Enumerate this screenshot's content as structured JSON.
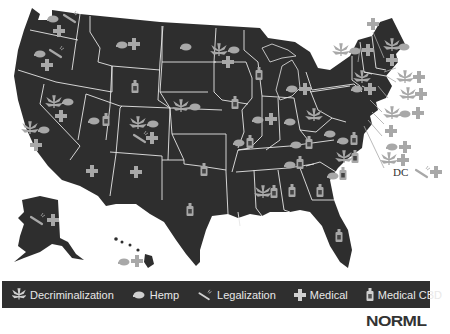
{
  "colors": {
    "land": "#2e2e2e",
    "border": "#e6e6e6",
    "icon": "#a8a8a8",
    "legend_bg": "#2f2f2f",
    "legend_text": "#e8e8e8",
    "logo": "#333333"
  },
  "legend": {
    "items": [
      {
        "icon": "leaf-icon",
        "label": "Decriminalization"
      },
      {
        "icon": "hemp-cap-icon",
        "label": "Hemp"
      },
      {
        "icon": "joint-icon",
        "label": "Legalization"
      },
      {
        "icon": "cross-icon",
        "label": "Medical"
      },
      {
        "icon": "bottle-icon",
        "label": "Medical CBD"
      }
    ]
  },
  "logo": {
    "text": "NORML"
  },
  "callouts": {
    "dc_label": "DC"
  },
  "states": [
    {
      "name": "WA",
      "policies": [
        "hemp",
        "legalization",
        "medical"
      ]
    },
    {
      "name": "OR",
      "policies": [
        "hemp",
        "legalization",
        "medical"
      ]
    },
    {
      "name": "CA",
      "policies": [
        "decriminalization",
        "hemp",
        "medical"
      ]
    },
    {
      "name": "NV",
      "policies": [
        "decriminalization",
        "hemp",
        "medical"
      ]
    },
    {
      "name": "MT",
      "policies": [
        "hemp",
        "medical"
      ]
    },
    {
      "name": "ND",
      "policies": [
        "hemp"
      ]
    },
    {
      "name": "WY",
      "policies": [
        "medical_cbd"
      ]
    },
    {
      "name": "UT",
      "policies": [
        "hemp",
        "medical_cbd"
      ]
    },
    {
      "name": "CO",
      "policies": [
        "decriminalization",
        "hemp",
        "legalization",
        "medical"
      ]
    },
    {
      "name": "NE",
      "policies": [
        "decriminalization",
        "hemp"
      ]
    },
    {
      "name": "AZ",
      "policies": [
        "medical"
      ]
    },
    {
      "name": "NM",
      "policies": [
        "medical"
      ]
    },
    {
      "name": "OK",
      "policies": [
        "medical_cbd"
      ]
    },
    {
      "name": "TX",
      "policies": [
        "medical_cbd"
      ]
    },
    {
      "name": "MN",
      "policies": [
        "decriminalization",
        "hemp",
        "medical"
      ]
    },
    {
      "name": "WI",
      "policies": [
        "medical_cbd"
      ]
    },
    {
      "name": "IA",
      "policies": [
        "medical_cbd"
      ]
    },
    {
      "name": "MO",
      "policies": [
        "hemp",
        "medical_cbd"
      ]
    },
    {
      "name": "IL",
      "policies": [
        "hemp",
        "medical"
      ]
    },
    {
      "name": "MI",
      "policies": [
        "hemp",
        "medical"
      ]
    },
    {
      "name": "IN",
      "policies": [
        "hemp"
      ]
    },
    {
      "name": "OH",
      "policies": [
        "decriminalization"
      ]
    },
    {
      "name": "KY",
      "policies": [
        "hemp",
        "medical_cbd"
      ]
    },
    {
      "name": "TN",
      "policies": [
        "hemp",
        "medical_cbd"
      ]
    },
    {
      "name": "MS",
      "policies": [
        "decriminalization",
        "medical_cbd"
      ]
    },
    {
      "name": "AL",
      "policies": [
        "medical_cbd"
      ]
    },
    {
      "name": "GA",
      "policies": [
        "medical_cbd"
      ]
    },
    {
      "name": "FL",
      "policies": [
        "medical_cbd"
      ]
    },
    {
      "name": "SC",
      "policies": [
        "hemp",
        "medical_cbd"
      ]
    },
    {
      "name": "NC",
      "policies": [
        "decriminalization",
        "medical_cbd"
      ]
    },
    {
      "name": "VA",
      "policies": [
        "hemp",
        "medical_cbd"
      ]
    },
    {
      "name": "WV",
      "policies": [
        "hemp"
      ]
    },
    {
      "name": "NY",
      "policies": [
        "decriminalization",
        "hemp",
        "medical"
      ]
    },
    {
      "name": "ME",
      "policies": [
        "decriminalization",
        "hemp",
        "medical"
      ]
    },
    {
      "name": "VT",
      "policies": [
        "decriminalization",
        "hemp",
        "medical"
      ]
    },
    {
      "name": "NH",
      "policies": [
        "medical"
      ]
    },
    {
      "name": "MA",
      "policies": [
        "decriminalization",
        "medical"
      ]
    },
    {
      "name": "RI",
      "policies": [
        "decriminalization",
        "medical"
      ]
    },
    {
      "name": "CT",
      "policies": [
        "decriminalization",
        "hemp",
        "medical"
      ]
    },
    {
      "name": "NJ",
      "policies": [
        "medical"
      ]
    },
    {
      "name": "DE",
      "policies": [
        "hemp",
        "medical"
      ]
    },
    {
      "name": "MD",
      "policies": [
        "decriminalization",
        "medical"
      ]
    },
    {
      "name": "DC",
      "policies": [
        "legalization",
        "medical"
      ]
    },
    {
      "name": "AK",
      "policies": [
        "legalization",
        "medical"
      ]
    },
    {
      "name": "HI",
      "policies": [
        "hemp",
        "medical"
      ]
    }
  ]
}
